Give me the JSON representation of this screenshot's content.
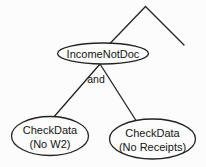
{
  "diagram": {
    "type": "tree",
    "colors": {
      "stroke": "#222222",
      "background": "#fcfcfc",
      "text": "#141414"
    },
    "nodes": {
      "parent": {
        "label": "IncomeNotDoc"
      },
      "operator": {
        "label": "and"
      },
      "left_leaf": {
        "label": "CheckData",
        "sublabel": "(No W2)"
      },
      "right_leaf": {
        "label": "CheckData",
        "sublabel": "(No Receipts)"
      }
    },
    "edges": [
      {
        "from": "offscreen-apex",
        "to": "IncomeNotDoc"
      },
      {
        "from": "offscreen-apex",
        "to": "offscreen-right-branch"
      },
      {
        "from": "IncomeNotDoc",
        "to": "CheckData (No W2)",
        "operator": "and"
      },
      {
        "from": "IncomeNotDoc",
        "to": "CheckData (No Receipts)",
        "operator": "and"
      }
    ]
  }
}
